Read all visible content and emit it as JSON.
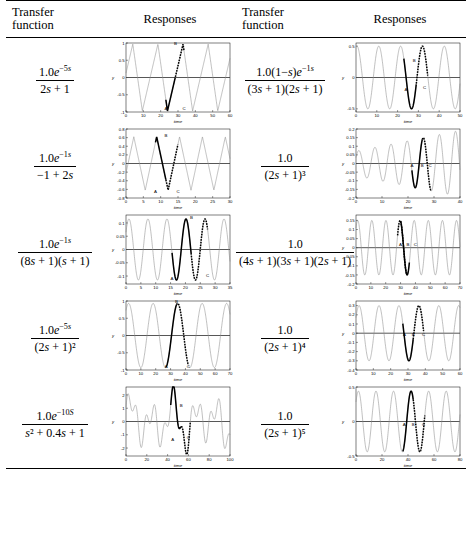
{
  "table": {
    "headers": [
      "Transfer function",
      "Responses",
      "Transfer function",
      "Responses"
    ],
    "header_tf_line1": "Transfer",
    "header_tf_line2": "function",
    "header_responses": "Responses"
  },
  "rows": [
    {
      "left": {
        "formula_text": "1.0e^(-5s) / (2s+1)",
        "num_pre": "1.0",
        "num_exp_base": "e",
        "num_exp": "−5s",
        "den": "2s + 1",
        "chart_ref": "chart_L1"
      },
      "right": {
        "formula_text": "1.0(1-s)e^(-1s) / ((3s+1)(2s+1))",
        "num_pre": "1.0(1−s)",
        "num_exp_base": "e",
        "num_exp": "−1s",
        "den": "(3s + 1)(2s + 1)",
        "chart_ref": "chart_R1"
      }
    },
    {
      "left": {
        "formula_text": "1.0e^(-1s) / (-1+2s)",
        "num_pre": "1.0",
        "num_exp_base": "e",
        "num_exp": "−1s",
        "den": "−1 + 2s",
        "chart_ref": "chart_L2"
      },
      "right": {
        "formula_text": "1.0 / (2s+1)^3",
        "num_pre": "1.0",
        "num_exp_base": "",
        "num_exp": "",
        "den": "(2s + 1)³",
        "chart_ref": "chart_R2"
      }
    },
    {
      "left": {
        "formula_text": "1.0e^(-1s) / ((8s+1)(s+1))",
        "num_pre": "1.0",
        "num_exp_base": "e",
        "num_exp": "−1s",
        "den": "(8s + 1)(s + 1)",
        "chart_ref": "chart_L3"
      },
      "right": {
        "formula_text": "1.0 / ((4s+1)(3s+1)(2s+1))",
        "num_pre": "1.0",
        "num_exp_base": "",
        "num_exp": "",
        "den": "(4s + 1)(3s + 1)(2s + 1)",
        "chart_ref": "chart_R3"
      }
    },
    {
      "left": {
        "formula_text": "1.0e^(-5s) / (2s+1)^2",
        "num_pre": "1.0",
        "num_exp_base": "e",
        "num_exp": "−5s",
        "den": "(2s + 1)²",
        "chart_ref": "chart_L4"
      },
      "right": {
        "formula_text": "1.0 / (2s+1)^4",
        "num_pre": "1.0",
        "num_exp_base": "",
        "num_exp": "",
        "den": "(2s + 1)⁴",
        "chart_ref": "chart_R4"
      }
    },
    {
      "left": {
        "formula_text": "1.0e^(-10S) / (s^2 + 0.4s + 1)",
        "num_pre": "1.0",
        "num_exp_base": "e",
        "num_exp": "−10S",
        "den": "s² + 0.4s + 1",
        "chart_ref": "chart_L5"
      },
      "right": {
        "formula_text": "1.0 / (2s+1)^5",
        "num_pre": "1.0",
        "num_exp_base": "",
        "num_exp": "",
        "den": "(2s + 1)⁵",
        "chart_ref": "chart_R5"
      }
    }
  ],
  "chart_data": [
    {
      "id": "chart_L1",
      "type": "line",
      "title": "",
      "xlabel": "time",
      "ylabel": "y",
      "xlim": [
        0,
        60
      ],
      "ylim": [
        -1,
        1
      ],
      "xticks": [
        0,
        10,
        20,
        30,
        40,
        50,
        60
      ],
      "yticks": [
        -1,
        -0.5,
        0,
        0.5,
        1
      ],
      "ytick_labels": [
        "-1",
        "-0.5",
        "0",
        "0.5",
        "1"
      ],
      "grid": false,
      "annotations": [
        {
          "label": "A",
          "x": 23,
          "y": -0.95
        },
        {
          "label": "B",
          "x": 28.5,
          "y": 0.95
        },
        {
          "label": "C",
          "x": 33.5,
          "y": -0.95
        }
      ],
      "series": [
        {
          "name": "full-response",
          "style": "thin",
          "period": 14.5,
          "amp": 0.97,
          "phase": 2.2,
          "shape": "sawish"
        },
        {
          "name": "highlight-solid",
          "style": "thick",
          "t0": 23,
          "t1": 28.5
        },
        {
          "name": "highlight-dashed",
          "style": "thick-dashed",
          "t0": 28.5,
          "t1": 33.5
        }
      ]
    },
    {
      "id": "chart_L2",
      "type": "line",
      "title": "",
      "xlabel": "time",
      "ylabel": "y",
      "xlim": [
        0,
        30
      ],
      "ylim": [
        -0.8,
        0.8
      ],
      "xticks": [
        0,
        5,
        10,
        15,
        20,
        25,
        30
      ],
      "yticks": [
        -0.8,
        -0.6,
        -0.4,
        -0.2,
        0,
        0.2,
        0.4,
        0.6,
        0.8
      ],
      "ytick_labels": [
        "-0.8",
        "-0.6",
        "-0.4",
        "-0.2",
        "0",
        "0.2",
        "0.4",
        "0.6",
        "0.8"
      ],
      "grid": false,
      "annotations": [
        {
          "label": "A",
          "x": 8.5,
          "y": -0.68
        },
        {
          "label": "B",
          "x": 11.5,
          "y": 0.62
        },
        {
          "label": "C",
          "x": 15,
          "y": -0.68
        }
      ],
      "series": [
        {
          "name": "full-response",
          "style": "thin",
          "period": 6.6,
          "amp": 0.62,
          "phase": 1.0,
          "shape": "tri"
        },
        {
          "name": "highlight-solid",
          "style": "thick",
          "t0": 8.5,
          "t1": 11.5
        },
        {
          "name": "highlight-dashed",
          "style": "thick-dashed",
          "t0": 11.5,
          "t1": 15
        }
      ]
    },
    {
      "id": "chart_L3",
      "type": "line",
      "title": "",
      "xlabel": "time",
      "ylabel": "y",
      "xlim": [
        0,
        35
      ],
      "ylim": [
        -0.13,
        0.13
      ],
      "xticks": [
        0,
        5,
        10,
        15,
        20,
        25,
        30,
        35
      ],
      "yticks": [
        -0.1,
        -0.05,
        0,
        0.05,
        0.1
      ],
      "ytick_labels": [
        "-0.1",
        "-0.05",
        "0",
        "0.05",
        "0.1"
      ],
      "grid": false,
      "annotations": [
        {
          "label": "A",
          "x": 15.5,
          "y": -0.115
        },
        {
          "label": "B",
          "x": 22,
          "y": 0.115
        },
        {
          "label": "C",
          "x": 27.5,
          "y": -0.105
        }
      ],
      "series": [
        {
          "name": "full-response",
          "style": "thin",
          "period": 6.4,
          "amp": 0.115,
          "phase": 0.6,
          "shape": "sine"
        },
        {
          "name": "highlight-solid",
          "style": "thick",
          "t0": 15.5,
          "t1": 22
        },
        {
          "name": "highlight-dashed",
          "style": "thick-dashed",
          "t0": 22,
          "t1": 27.5
        }
      ]
    },
    {
      "id": "chart_L4",
      "type": "line",
      "title": "",
      "xlabel": "time",
      "ylabel": "y",
      "xlim": [
        0,
        70
      ],
      "ylim": [
        -1,
        1
      ],
      "xticks": [
        0,
        10,
        20,
        30,
        40,
        50,
        60,
        70
      ],
      "yticks": [
        -1,
        -0.5,
        0,
        0.5,
        1
      ],
      "ytick_labels": [
        "-1",
        "-0.5",
        "0",
        "0.5",
        "1"
      ],
      "grid": false,
      "annotations": [
        {
          "label": "A",
          "x": 27,
          "y": -0.95
        },
        {
          "label": "B",
          "x": 34,
          "y": 0.95
        },
        {
          "label": "C",
          "x": 42,
          "y": -0.95
        }
      ],
      "series": [
        {
          "name": "full-response",
          "style": "thin",
          "period": 16.5,
          "amp": 0.93,
          "phase": 0.9,
          "shape": "sine"
        },
        {
          "name": "highlight-solid",
          "style": "thick",
          "t0": 27,
          "t1": 34
        },
        {
          "name": "highlight-dashed",
          "style": "thick-dashed",
          "t0": 34,
          "t1": 42
        }
      ]
    },
    {
      "id": "chart_L5",
      "type": "line",
      "title": "",
      "xlabel": "time",
      "ylabel": "y",
      "xlim": [
        0,
        100
      ],
      "ylim": [
        -2.6,
        2.6
      ],
      "xticks": [
        0,
        20,
        40,
        60,
        80,
        100
      ],
      "yticks": [
        -2,
        -1,
        0,
        1,
        2
      ],
      "ytick_labels": [
        "-2",
        "-1",
        "0",
        "1",
        "2"
      ],
      "grid": false,
      "annotations": [
        {
          "label": "A",
          "x": 45,
          "y": -1.5
        },
        {
          "label": "B",
          "x": 53,
          "y": 1.1
        },
        {
          "label": "C",
          "x": 60,
          "y": -1.3
        }
      ],
      "series": [
        {
          "name": "full-response",
          "style": "thin",
          "period": 21,
          "amp": 1.9,
          "phase": 0.4,
          "shape": "beat"
        },
        {
          "name": "highlight-solid",
          "style": "thick",
          "t0": 43,
          "t1": 53
        },
        {
          "name": "highlight-dashed",
          "style": "thick-dashed",
          "t0": 53,
          "t1": 62
        }
      ]
    },
    {
      "id": "chart_R1",
      "type": "line",
      "title": "",
      "xlabel": "time",
      "ylabel": "y",
      "xlim": [
        0,
        50
      ],
      "ylim": [
        -0.55,
        0.55
      ],
      "xticks": [
        0,
        10,
        20,
        30,
        40,
        50
      ],
      "yticks": [
        -0.5,
        0,
        0.5
      ],
      "ytick_labels": [
        "-0.5",
        "0",
        "0.5"
      ],
      "grid": false,
      "annotations": [
        {
          "label": "A",
          "x": 24,
          "y": -0.22
        },
        {
          "label": "B",
          "x": 28,
          "y": 0.25
        },
        {
          "label": "C",
          "x": 33,
          "y": -0.18
        }
      ],
      "series": [
        {
          "name": "full-response",
          "style": "thin",
          "period": 10.5,
          "amp": 0.5,
          "phase": 1.3,
          "shape": "sine"
        },
        {
          "name": "highlight-solid",
          "style": "thick",
          "t0": 23,
          "t1": 29
        },
        {
          "name": "highlight-dashed",
          "style": "thick-dashed",
          "t0": 29,
          "t1": 34.5
        }
      ]
    },
    {
      "id": "chart_R2",
      "type": "line",
      "title": "",
      "xlabel": "time",
      "ylabel": "y",
      "xlim": [
        0,
        40
      ],
      "ylim": [
        -0.2,
        0.2
      ],
      "xticks": [
        0,
        10,
        20,
        30,
        40
      ],
      "yticks": [
        -0.2,
        -0.15,
        -0.1,
        -0.05,
        0,
        0.05,
        0.1,
        0.15,
        0.2
      ],
      "ytick_labels": [
        "-0.2",
        "-0.15",
        "-0.1",
        "-0.05",
        "0",
        "0.05",
        "0.1",
        "0.15",
        "0.2"
      ],
      "grid": false,
      "annotations": [
        {
          "label": "A",
          "x": 21.5,
          "y": -0.022
        },
        {
          "label": "B",
          "x": 25.5,
          "y": -0.022
        },
        {
          "label": "C",
          "x": 28.5,
          "y": -0.022
        }
      ],
      "series": [
        {
          "name": "full-response",
          "style": "thin",
          "period": 6.2,
          "amp": 0.16,
          "phase": 0.5,
          "shape": "growing-sine"
        },
        {
          "name": "highlight-solid",
          "style": "thick",
          "t0": 21.5,
          "t1": 25.5
        },
        {
          "name": "highlight-dashed",
          "style": "thick-dashed",
          "t0": 25.5,
          "t1": 29
        }
      ]
    },
    {
      "id": "chart_R3",
      "type": "line",
      "title": "",
      "xlabel": "time",
      "ylabel": "y",
      "xlim": [
        0,
        70
      ],
      "ylim": [
        -0.2,
        0.18
      ],
      "xticks": [
        0,
        10,
        20,
        30,
        40,
        50,
        60,
        70
      ],
      "yticks": [
        -0.2,
        -0.15,
        -0.1,
        -0.05,
        0,
        0.05,
        0.1,
        0.15
      ],
      "ytick_labels": [
        "-0.2",
        "-0.15",
        "-0.1",
        "-0.05",
        "0",
        "0.05",
        "0.1",
        "0.15"
      ],
      "grid": false,
      "annotations": [
        {
          "label": "A",
          "x": 30,
          "y": 0.012
        },
        {
          "label": "B",
          "x": 35,
          "y": 0.012
        },
        {
          "label": "C",
          "x": 40,
          "y": 0.012
        }
      ],
      "series": [
        {
          "name": "full-response",
          "style": "thin",
          "period": 9.5,
          "amp": 0.15,
          "phase": 0.8,
          "shape": "sine"
        },
        {
          "name": "highlight-solid",
          "style": "thick",
          "t0": 30,
          "t1": 36
        },
        {
          "name": "highlight-dashed",
          "style": "thick-dashed",
          "t0": 28,
          "t1": 34
        }
      ]
    },
    {
      "id": "chart_R4",
      "type": "line",
      "title": "",
      "xlabel": "time",
      "ylabel": "y",
      "xlim": [
        0,
        60
      ],
      "ylim": [
        -0.4,
        0.35
      ],
      "xticks": [
        0,
        10,
        20,
        30,
        40,
        50,
        60
      ],
      "yticks": [
        -0.4,
        -0.3,
        -0.2,
        -0.1,
        0,
        0.1,
        0.2,
        0.3
      ],
      "ytick_labels": [
        "-0.4",
        "-0.3",
        "-0.2",
        "-0.1",
        "0",
        "0.1",
        "0.2",
        "0.3"
      ],
      "grid": false,
      "annotations": [
        {
          "label": "A",
          "x": 28,
          "y": -0.035
        },
        {
          "label": "B",
          "x": 33,
          "y": -0.035
        },
        {
          "label": "C",
          "x": 39,
          "y": -0.035
        }
      ],
      "series": [
        {
          "name": "full-response",
          "style": "thin",
          "period": 11.5,
          "amp": 0.3,
          "phase": 0.6,
          "shape": "sine"
        },
        {
          "name": "highlight-solid",
          "style": "thick",
          "t0": 27,
          "t1": 33
        },
        {
          "name": "highlight-dashed",
          "style": "thick-dashed",
          "t0": 33,
          "t1": 39
        }
      ]
    },
    {
      "id": "chart_R5",
      "type": "line",
      "title": "",
      "xlabel": "time",
      "ylabel": "y",
      "xlim": [
        0,
        80
      ],
      "ylim": [
        -0.5,
        0.5
      ],
      "xticks": [
        0,
        20,
        40,
        60,
        80
      ],
      "yticks": [
        -0.5,
        0,
        0.5
      ],
      "ytick_labels": [
        "-0.5",
        "0",
        "0.5"
      ],
      "grid": false,
      "annotations": [
        {
          "label": "A",
          "x": 37,
          "y": -0.06
        },
        {
          "label": "B",
          "x": 44,
          "y": -0.06
        },
        {
          "label": "C",
          "x": 52,
          "y": -0.06
        }
      ],
      "series": [
        {
          "name": "full-response",
          "style": "thin",
          "period": 13.5,
          "amp": 0.44,
          "phase": 0.7,
          "shape": "sine"
        },
        {
          "name": "highlight-solid",
          "style": "thick",
          "t0": 36,
          "t1": 44
        },
        {
          "name": "highlight-dashed",
          "style": "thick-dashed",
          "t0": 44,
          "t1": 53
        }
      ]
    }
  ],
  "colors": {
    "line_thin": "#8c8c8c",
    "line_thick": "#000000",
    "axis": "#000000",
    "zero_line": "#444444",
    "background": "#ffffff"
  }
}
